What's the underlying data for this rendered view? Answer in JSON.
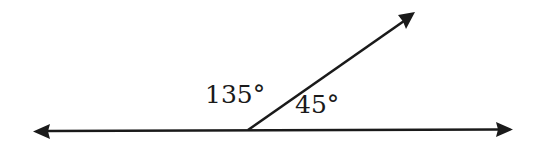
{
  "diagram": {
    "type": "angle-diagram",
    "colors": {
      "stroke": "#1a1a1a",
      "background": "#ffffff"
    },
    "line": {
      "left_arrow": true,
      "right_arrow": true
    },
    "ray": {
      "arrow": true
    },
    "angles": [
      {
        "name": "obtuse-angle",
        "label": "135°",
        "value": 135
      },
      {
        "name": "acute-angle",
        "label": "45°",
        "value": 45
      }
    ]
  }
}
